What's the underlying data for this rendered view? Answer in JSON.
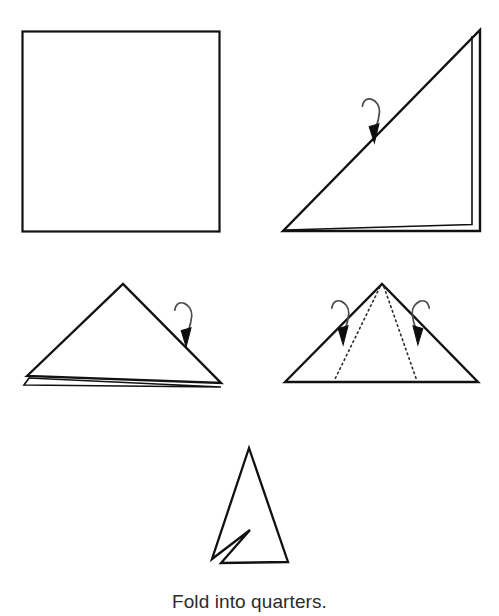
{
  "document": {
    "type": "origami-folding-instruction-diagram",
    "caption": "Fold into quarters.",
    "background_color": "#ffffff",
    "stroke_color": "#111111"
  },
  "steps": [
    {
      "id": "step-1-square",
      "label": "square-sheet",
      "description": "Unfolded square sheet of paper",
      "shape": "square",
      "layers": 1,
      "arrows": [],
      "dotted_creases": 0
    },
    {
      "id": "step-2-right-triangle",
      "label": "diagonal-fold",
      "description": "Square folded in half along the diagonal into a right triangle",
      "shape": "right-triangle",
      "layers": 2,
      "arrows": [
        "fold-over-arrow-down-right"
      ],
      "dotted_creases": 0
    },
    {
      "id": "step-3-isosceles-triangle",
      "label": "half-fold",
      "description": "Right triangle folded again into a smaller isosceles triangle",
      "shape": "isosceles-triangle",
      "layers": 2,
      "arrows": [
        "fold-over-arrow-down-left"
      ],
      "dotted_creases": 0
    },
    {
      "id": "step-4-triangle-with-creases",
      "label": "quarter-creases",
      "description": "Triangle marked with two dotted crease lines, both side flaps folded inward",
      "shape": "isosceles-triangle",
      "layers": 1,
      "arrows": [
        "fold-over-arrow-inward-left",
        "fold-over-arrow-inward-right"
      ],
      "dotted_creases": 2
    },
    {
      "id": "step-5-narrow-kite",
      "label": "folded-quarters-result",
      "description": "Final narrow folded shape, the paper folded into quarters",
      "shape": "narrow-kite",
      "layers": 1,
      "arrows": [],
      "dotted_creases": 0
    }
  ],
  "geometry": {
    "square": {
      "x": 22,
      "y": 31,
      "width": 198,
      "height": 201
    },
    "triangle_top_right": {
      "outer": "283,231 480,231 480,30",
      "inner_layer": "287,229 473,226 473,36"
    },
    "triangle_mid_left": {
      "outer": "27,376 123,284 221,383",
      "inner_layer": "30,383 221,387 33,379"
    },
    "triangle_mid_right": {
      "outer": "285,382 382,284 478,382",
      "crease_left": "380,285 334,381",
      "crease_right": "384,285 417,381"
    },
    "kite": "249,448 288,562 221,563 250,530 212,559"
  },
  "arrows": [
    {
      "name": "arrow-step2",
      "cx": 364,
      "cy": 126,
      "rotation": 44,
      "mirrored": false
    },
    {
      "name": "arrow-step3",
      "cx": 176,
      "cy": 330,
      "rotation": 45,
      "mirrored": false
    },
    {
      "name": "arrow-step4-left",
      "cx": 333,
      "cy": 328,
      "rotation": 45,
      "mirrored": false
    },
    {
      "name": "arrow-step4-right",
      "cx": 428,
      "cy": 328,
      "rotation": 45,
      "mirrored": true
    }
  ]
}
